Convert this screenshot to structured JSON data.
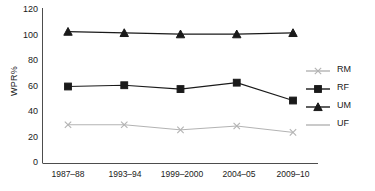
{
  "chart_data": {
    "type": "line",
    "title": "",
    "xlabel": "",
    "ylabel": "WPR%",
    "categories": [
      "1987–88",
      "1993–94",
      "1999–2000",
      "2004–05",
      "2009–10"
    ],
    "ylim": [
      0,
      120
    ],
    "yticks": [
      0,
      20,
      40,
      60,
      80,
      100,
      120
    ],
    "grid": false,
    "legend_position": "right",
    "series": [
      {
        "name": "RM",
        "values": [
          30,
          30,
          26,
          29,
          24
        ],
        "color": "#b3b3b3",
        "marker": "x"
      },
      {
        "name": "RF",
        "values": [
          60,
          61,
          58,
          63,
          49
        ],
        "color": "#1a1a1a",
        "marker": "square"
      },
      {
        "name": "UM",
        "values": [
          103,
          102,
          101,
          101,
          102
        ],
        "color": "#1a1a1a",
        "marker": "triangle"
      },
      {
        "name": "UF",
        "values": [
          null,
          null,
          null,
          null,
          null
        ],
        "color": "#b3b3b3",
        "marker": "none"
      }
    ]
  },
  "legend": {
    "items": [
      {
        "label": "RM"
      },
      {
        "label": "RF"
      },
      {
        "label": "UM"
      },
      {
        "label": "UF"
      }
    ]
  },
  "axis": {
    "y_label": "WPR%",
    "y_tick_labels": [
      "120",
      "100",
      "80",
      "60",
      "40",
      "20",
      "0"
    ],
    "x_tick_labels": [
      "1987–88",
      "1993–94",
      "1999–2000",
      "2004–05",
      "2009–10"
    ]
  },
  "colors": {
    "axis": "#4d4d4d",
    "dark_series": "#1a1a1a",
    "light_series": "#b3b3b3",
    "background": "#ffffff"
  }
}
